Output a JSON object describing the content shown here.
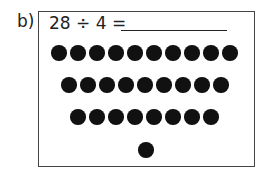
{
  "question": {
    "label": "b)",
    "equation": "28 ÷ 4 =",
    "answer_blank": ""
  },
  "dots": {
    "rows": [
      10,
      9,
      8,
      1
    ],
    "total": 28
  }
}
